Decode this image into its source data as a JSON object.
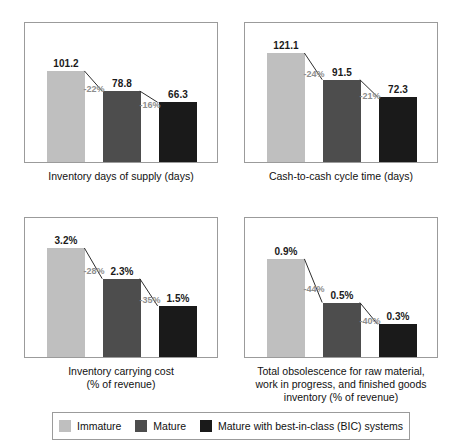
{
  "series_names": [
    "Immature",
    "Mature",
    "Mature with best-in-class (BIC) systems"
  ],
  "colors": {
    "immature": "#bfbfbf",
    "mature": "#4d4d4d",
    "bic": "#1a1a1a",
    "connector": "#2b2b2b",
    "delta_text": "#8d8d8d",
    "panel_border": "#9b9b9b",
    "background": "#ffffff"
  },
  "legend": {
    "items": [
      {
        "label": "Immature",
        "color": "#bfbfbf"
      },
      {
        "label": "Mature",
        "color": "#4d4d4d"
      },
      {
        "label": "Mature with best-in-class (BIC) systems",
        "color": "#1a1a1a"
      }
    ]
  },
  "panels": [
    {
      "caption_lines": [
        "Inventory days of supply (days)"
      ],
      "value_labels": [
        "101.2",
        "78.8",
        "66.3"
      ],
      "delta_labels": [
        "-22%",
        "-16%"
      ]
    },
    {
      "caption_lines": [
        "Cash-to-cash cycle time (days)"
      ],
      "value_labels": [
        "121.1",
        "91.5",
        "72.3"
      ],
      "delta_labels": [
        "-24%",
        "-21%"
      ]
    },
    {
      "caption_lines": [
        "Inventory carrying cost",
        "(% of revenue)"
      ],
      "value_labels": [
        "3.2%",
        "2.3%",
        "1.5%"
      ],
      "delta_labels": [
        "-28%",
        "-35%"
      ]
    },
    {
      "caption_lines": [
        "Total obsolescence for raw material,",
        "work in progress, and finished goods",
        "inventory (% of revenue)"
      ],
      "value_labels": [
        "0.9%",
        "0.5%",
        "0.3%"
      ],
      "delta_labels": [
        "-44%",
        "-40%"
      ]
    }
  ],
  "chart_data": [
    {
      "type": "bar",
      "title": "Inventory days of supply (days)",
      "xlabel": "",
      "ylabel": "days",
      "categories": [
        "Immature",
        "Mature",
        "Mature with best-in-class (BIC) systems"
      ],
      "values": [
        101.2,
        78.8,
        66.3
      ],
      "value_labels": [
        "101.2",
        "78.8",
        "66.3"
      ],
      "deltas": [
        "-22%",
        "-16%"
      ],
      "ylim": [
        0,
        121.1
      ],
      "grid": false,
      "legend_position": "bottom"
    },
    {
      "type": "bar",
      "title": "Cash-to-cash cycle time (days)",
      "xlabel": "",
      "ylabel": "days",
      "categories": [
        "Immature",
        "Mature",
        "Mature with best-in-class (BIC) systems"
      ],
      "values": [
        121.1,
        91.5,
        72.3
      ],
      "value_labels": [
        "121.1",
        "91.5",
        "72.3"
      ],
      "deltas": [
        "-24%",
        "-21%"
      ],
      "ylim": [
        0,
        121.1
      ],
      "grid": false,
      "legend_position": "bottom"
    },
    {
      "type": "bar",
      "title": "Inventory carrying cost (% of revenue)",
      "xlabel": "",
      "ylabel": "% of revenue",
      "categories": [
        "Immature",
        "Mature",
        "Mature with best-in-class (BIC) systems"
      ],
      "values": [
        3.2,
        2.3,
        1.5
      ],
      "value_labels": [
        "3.2%",
        "2.3%",
        "1.5%"
      ],
      "deltas": [
        "-28%",
        "-35%"
      ],
      "ylim": [
        0,
        3.2
      ],
      "grid": false,
      "legend_position": "bottom"
    },
    {
      "type": "bar",
      "title": "Total obsolescence for raw material, work in progress, and finished goods inventory (% of revenue)",
      "xlabel": "",
      "ylabel": "% of revenue",
      "categories": [
        "Immature",
        "Mature",
        "Mature with best-in-class (BIC) systems"
      ],
      "values": [
        0.9,
        0.5,
        0.3
      ],
      "value_labels": [
        "0.9%",
        "0.5%",
        "0.3%"
      ],
      "deltas": [
        "-44%",
        "-40%"
      ],
      "ylim": [
        0,
        1.0
      ],
      "grid": false,
      "legend_position": "bottom"
    }
  ]
}
